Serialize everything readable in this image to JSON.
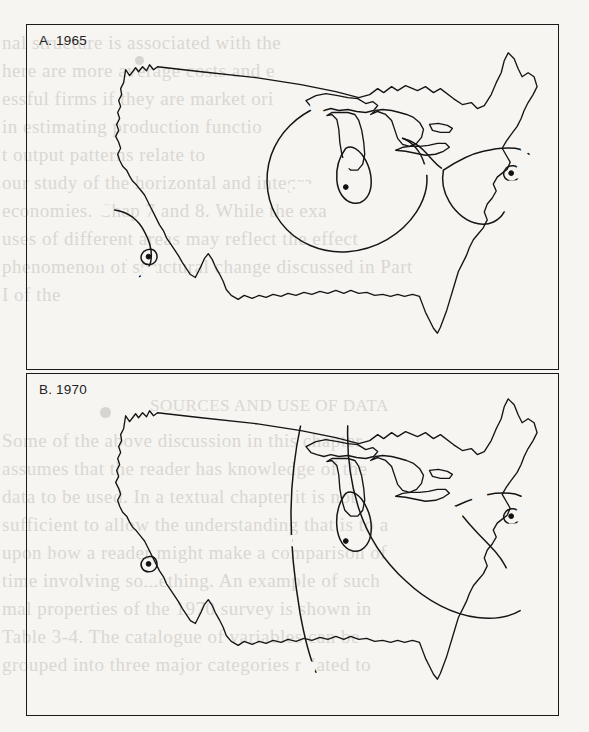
{
  "figure": {
    "panels": [
      {
        "id": "panel-a",
        "label": "A. 1965",
        "year": "1965",
        "cities": [
          {
            "name": "Los Angeles",
            "x": 60,
            "y": 223
          },
          {
            "name": "Chicago",
            "x": 318,
            "y": 159
          },
          {
            "name": "New York",
            "x": 492,
            "y": 143
          }
        ],
        "contour_labels": [
          {
            "value": "50",
            "x": 76,
            "y": 186
          },
          {
            "value": "50",
            "x": 146,
            "y": 240
          },
          {
            "value": "25",
            "x": 131,
            "y": 245
          },
          {
            "value": "50",
            "x": 288,
            "y": 104
          },
          {
            "value": "25",
            "x": 325,
            "y": 128
          },
          {
            "value": "50",
            "x": 455,
            "y": 133
          },
          {
            "value": "50",
            "x": 508,
            "y": 117
          },
          {
            "value": "25",
            "x": 490,
            "y": 159
          }
        ]
      },
      {
        "id": "panel-b",
        "label": "B. 1970",
        "year": "1970",
        "cities": [
          {
            "name": "Los Angeles",
            "x": 25,
            "y": 190
          },
          {
            "name": "Chicago",
            "x": 318,
            "y": 164
          },
          {
            "name": "New York",
            "x": 492,
            "y": 135
          }
        ],
        "contour_labels": [
          {
            "value": "25",
            "x": 135,
            "y": 212
          },
          {
            "value": "50",
            "x": 272,
            "y": 45
          },
          {
            "value": "50",
            "x": 320,
            "y": 45
          },
          {
            "value": "25",
            "x": 390,
            "y": 125
          },
          {
            "value": "50",
            "x": 490,
            "y": 122
          },
          {
            "value": "50",
            "x": 458,
            "y": 135
          },
          {
            "value": "25",
            "x": 488,
            "y": 153
          },
          {
            "value": "50",
            "x": 468,
            "y": 200
          },
          {
            "value": "50",
            "x": 262,
            "y": 292
          }
        ]
      }
    ]
  },
  "bleed_text": {
    "lines": [
      {
        "text": "nal structure is associated with the",
        "x": 2,
        "y": 32,
        "size": 19
      },
      {
        "text": "here are more average costs and e",
        "x": 2,
        "y": 60,
        "size": 19
      },
      {
        "text": "essful firms if they are market ori",
        "x": 2,
        "y": 88,
        "size": 19
      },
      {
        "text": "in estimating production functio",
        "x": 2,
        "y": 116,
        "size": 19
      },
      {
        "text": "t output patterns relate to",
        "x": 2,
        "y": 144,
        "size": 19
      },
      {
        "text": "our study of the horizontal and integra",
        "x": 2,
        "y": 172,
        "size": 19
      },
      {
        "text": "economies. Chap 7 and 8. While the exa",
        "x": 2,
        "y": 200,
        "size": 19
      },
      {
        "text": "uses of different areas may reflect the effect",
        "x": 2,
        "y": 228,
        "size": 19
      },
      {
        "text": "phenomenon of structural change discussed in Part",
        "x": 2,
        "y": 256,
        "size": 19
      },
      {
        "text": "I of the",
        "x": 2,
        "y": 284,
        "size": 19
      },
      {
        "text": "SOURCES AND USE OF DATA",
        "x": 150,
        "y": 396,
        "size": 17
      },
      {
        "text": "Some of the above discussion in this chapter",
        "x": 2,
        "y": 430,
        "size": 19
      },
      {
        "text": "assumes that the reader has knowledge of the",
        "x": 2,
        "y": 458,
        "size": 19
      },
      {
        "text": "data to be used. In a textual chapter it is not",
        "x": 2,
        "y": 486,
        "size": 19
      },
      {
        "text": "sufficient to allow the understanding that is to a",
        "x": 2,
        "y": 514,
        "size": 19
      },
      {
        "text": "upon how a reader might make a comparison of",
        "x": 2,
        "y": 542,
        "size": 19
      },
      {
        "text": "time involving something. An example of such",
        "x": 2,
        "y": 570,
        "size": 19
      },
      {
        "text": "mal properties of the 1970 survey is shown in",
        "x": 2,
        "y": 598,
        "size": 19
      },
      {
        "text": "Table 3-4. The catalogue of variables can be",
        "x": 2,
        "y": 626,
        "size": 19
      },
      {
        "text": "grouped into three major categories related to",
        "x": 2,
        "y": 654,
        "size": 19
      }
    ]
  },
  "colors": {
    "paper": "#f6f5f2",
    "ink": "#151515",
    "bleed": "#c9c6c0"
  }
}
